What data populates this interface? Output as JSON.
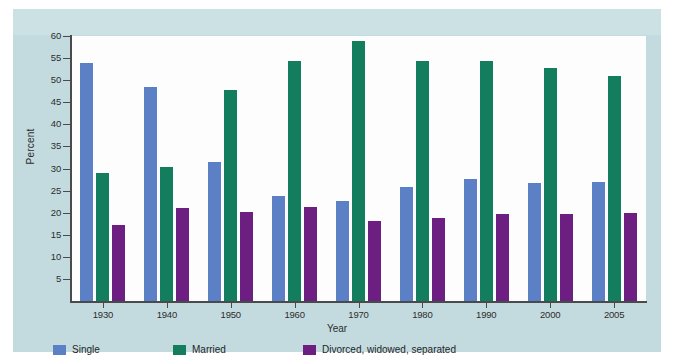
{
  "chart_data": {
    "type": "bar",
    "title": "",
    "subtitle": "",
    "xlabel": "Year",
    "ylabel": "Percent",
    "ylim": [
      0,
      60
    ],
    "ytick_step": 5,
    "yticks": [
      0,
      5,
      10,
      15,
      20,
      25,
      30,
      35,
      40,
      45,
      50,
      55,
      60
    ],
    "ytick_labels": [
      "",
      "5",
      "10",
      "15",
      "20",
      "25",
      "30",
      "35",
      "40",
      "45",
      "50",
      "55",
      "60"
    ],
    "grid": false,
    "legend_position": "bottom-left",
    "categories": [
      "1930",
      "1940",
      "1950",
      "1960",
      "1970",
      "1980",
      "1990",
      "2000",
      "2005"
    ],
    "series": [
      {
        "name": "Single",
        "color": "#5c80c6",
        "values": [
          53.8,
          48.4,
          31.5,
          23.8,
          22.6,
          25.8,
          27.7,
          26.7,
          26.9
        ]
      },
      {
        "name": "Married",
        "color": "#137e5e",
        "values": [
          28.9,
          30.4,
          47.8,
          54.3,
          58.8,
          54.4,
          54.3,
          52.8,
          51.0
        ]
      },
      {
        "name": "Divorced, widowed, separated",
        "color": "#6c1f80",
        "values": [
          17.3,
          21.1,
          20.2,
          21.3,
          18.1,
          18.7,
          19.7,
          19.6,
          20.0
        ]
      }
    ]
  },
  "colors": {
    "panel_background": "#c3dbdf",
    "panel_top_band": "#cbe1e4",
    "plot_background": "#fdfdfd",
    "axis": "#4a4a4a",
    "text": "#2d2d2d",
    "single": "#5c80c6",
    "married": "#137e5e",
    "divorced": "#6c1f80"
  }
}
